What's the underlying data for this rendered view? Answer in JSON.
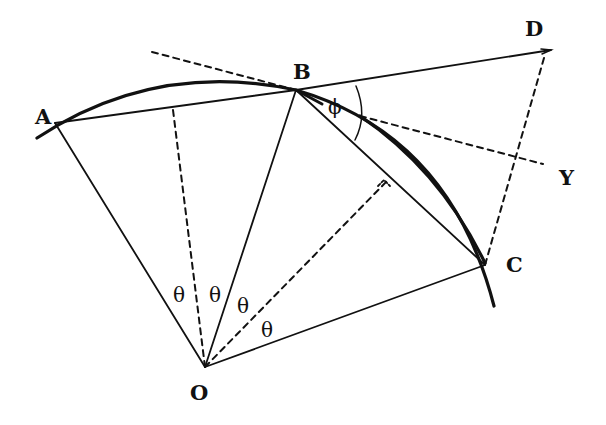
{
  "diagram": {
    "type": "geometry-construction",
    "stroke_color": "#111111",
    "background": "#ffffff",
    "points": {
      "A": {
        "label": "A",
        "x": 55,
        "y": 123
      },
      "B": {
        "label": "B",
        "x": 296,
        "y": 90
      },
      "C": {
        "label": "C",
        "x": 485,
        "y": 265
      },
      "D": {
        "label": "D",
        "x": 549,
        "y": 50
      },
      "O": {
        "label": "O",
        "x": 205,
        "y": 367
      },
      "Y": {
        "label": "Y"
      }
    },
    "angle_labels": {
      "theta_1": "θ",
      "theta_2": "θ",
      "theta_3": "θ",
      "theta_4": "θ",
      "phi": "ϕ"
    },
    "labels": {
      "A": "A",
      "B": "B",
      "C": "C",
      "D": "D",
      "O": "O",
      "Y": "Y"
    },
    "elements": [
      {
        "kind": "arc",
        "name": "circular-arc-A-to-C",
        "style": "solid-thick"
      },
      {
        "kind": "arc",
        "name": "displaced-arc-near-C",
        "style": "solid-thick"
      },
      {
        "kind": "segment",
        "name": "chord-AB",
        "from": "A",
        "to": "B",
        "style": "solid"
      },
      {
        "kind": "segment",
        "name": "chord-BC",
        "from": "B",
        "to": "C",
        "style": "solid"
      },
      {
        "kind": "segment",
        "name": "radius-OA",
        "from": "O",
        "to": "A",
        "style": "solid"
      },
      {
        "kind": "segment",
        "name": "radius-OB",
        "from": "O",
        "to": "B",
        "style": "solid"
      },
      {
        "kind": "segment",
        "name": "radius-OC",
        "from": "O",
        "to": "C",
        "style": "solid"
      },
      {
        "kind": "segment",
        "name": "line-BD-extension",
        "from": "B",
        "to": "D",
        "style": "solid"
      },
      {
        "kind": "segment",
        "name": "bisector-AB",
        "from": "O",
        "style": "dashed"
      },
      {
        "kind": "segment",
        "name": "bisector-BC",
        "from": "O",
        "style": "dashed"
      },
      {
        "kind": "segment",
        "name": "line-DC",
        "from": "D",
        "to": "C",
        "style": "dashed"
      },
      {
        "kind": "segment",
        "name": "tangent-at-B",
        "style": "dashed"
      },
      {
        "kind": "segment",
        "name": "line-to-Y",
        "style": "dashed"
      },
      {
        "kind": "arc",
        "name": "angle-phi-arc",
        "style": "thin"
      },
      {
        "kind": "mark",
        "name": "right-angle-marker"
      }
    ]
  }
}
